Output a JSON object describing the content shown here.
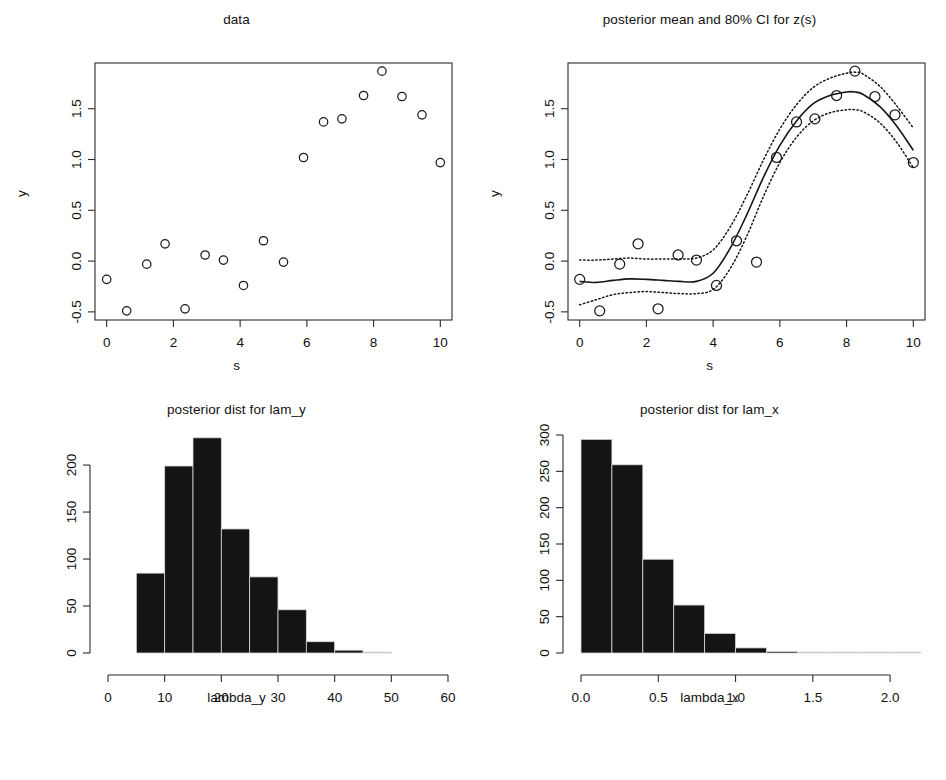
{
  "figure": {
    "width": 946,
    "height": 780,
    "background": "#ffffff",
    "foreground": "#111111",
    "bar_color": "#141414"
  },
  "panels": {
    "data": {
      "title": "data",
      "xlabel": "s",
      "ylabel": "y"
    },
    "posterior": {
      "title": "posterior mean and 80% CI for z(s)",
      "xlabel": "s",
      "ylabel": "y"
    },
    "lam_y": {
      "title": "posterior dist for lam_y",
      "xlabel": "lambda_y",
      "ylabel": ""
    },
    "lam_x": {
      "title": "posterior dist for lam_x",
      "xlabel": "lambda_x",
      "ylabel": ""
    }
  },
  "chart_data": [
    {
      "id": "data",
      "type": "scatter",
      "title": "data",
      "xlabel": "s",
      "ylabel": "y",
      "xlim": [
        -0.35,
        10.35
      ],
      "ylim": [
        -0.58,
        1.95
      ],
      "xticks": [
        0,
        2,
        4,
        6,
        8,
        10
      ],
      "xticklabels": [
        "0",
        "2",
        "4",
        "6",
        "8",
        "10"
      ],
      "yticks": [
        -0.5,
        0.0,
        0.5,
        1.0,
        1.5
      ],
      "yticklabels": [
        "-0.5",
        "0.0",
        "0.5",
        "1.0",
        "1.5"
      ],
      "grid": false,
      "legend": false,
      "marker": "open-circle",
      "x": [
        0.0,
        0.6,
        1.2,
        1.75,
        2.35,
        2.95,
        3.5,
        4.1,
        4.7,
        5.3,
        5.9,
        6.5,
        7.05,
        7.7,
        8.25,
        8.85,
        9.45,
        10.0
      ],
      "y": [
        -0.18,
        -0.49,
        -0.03,
        0.17,
        -0.47,
        0.06,
        0.01,
        -0.24,
        0.2,
        -0.01,
        1.02,
        1.37,
        1.4,
        1.63,
        1.87,
        1.62,
        1.44,
        0.97
      ]
    },
    {
      "id": "posterior",
      "type": "line",
      "title": "posterior mean and 80% CI for z(s)",
      "xlabel": "s",
      "ylabel": "y",
      "xlim": [
        -0.35,
        10.35
      ],
      "ylim": [
        -0.58,
        1.95
      ],
      "xticks": [
        0,
        2,
        4,
        6,
        8,
        10
      ],
      "xticklabels": [
        "0",
        "2",
        "4",
        "6",
        "8",
        "10"
      ],
      "yticks": [
        -0.5,
        0.0,
        0.5,
        1.0,
        1.5
      ],
      "yticklabels": [
        "-0.5",
        "0.0",
        "0.5",
        "1.0",
        "1.5"
      ],
      "grid": false,
      "legend": false,
      "marker": "open-circle",
      "scatter_x": [
        0.0,
        0.6,
        1.2,
        1.75,
        2.35,
        2.95,
        3.5,
        4.1,
        4.7,
        5.3,
        5.9,
        6.5,
        7.05,
        7.7,
        8.25,
        8.85,
        9.45,
        10.0
      ],
      "scatter_y": [
        -0.18,
        -0.49,
        -0.03,
        0.17,
        -0.47,
        0.06,
        0.01,
        -0.24,
        0.2,
        -0.01,
        1.02,
        1.37,
        1.4,
        1.63,
        1.87,
        1.62,
        1.44,
        0.97
      ],
      "series": [
        {
          "name": "posterior mean",
          "style": "solid",
          "x": [
            0.0,
            0.5,
            1.0,
            1.5,
            2.0,
            2.5,
            3.0,
            3.5,
            4.0,
            4.5,
            5.0,
            5.5,
            6.0,
            6.5,
            7.0,
            7.5,
            8.0,
            8.25,
            8.5,
            9.0,
            9.5,
            10.0
          ],
          "y": [
            -0.2,
            -0.21,
            -0.19,
            -0.175,
            -0.18,
            -0.19,
            -0.2,
            -0.2,
            -0.12,
            0.12,
            0.45,
            0.82,
            1.14,
            1.38,
            1.55,
            1.63,
            1.665,
            1.665,
            1.64,
            1.52,
            1.33,
            1.09
          ]
        },
        {
          "name": "80% CI upper",
          "style": "dotted",
          "x": [
            0.0,
            0.5,
            1.0,
            1.5,
            2.0,
            2.5,
            3.0,
            3.5,
            4.0,
            4.5,
            5.0,
            5.5,
            6.0,
            6.5,
            7.0,
            7.5,
            8.0,
            8.25,
            8.5,
            9.0,
            9.5,
            10.0
          ],
          "y": [
            0.01,
            0.01,
            0.02,
            0.03,
            0.02,
            0.02,
            0.02,
            0.03,
            0.11,
            0.33,
            0.64,
            0.99,
            1.3,
            1.54,
            1.71,
            1.8,
            1.85,
            1.86,
            1.84,
            1.72,
            1.53,
            1.31
          ]
        },
        {
          "name": "80% CI lower",
          "style": "dotted",
          "x": [
            0.0,
            0.5,
            1.0,
            1.5,
            2.0,
            2.5,
            3.0,
            3.5,
            4.0,
            4.5,
            5.0,
            5.5,
            6.0,
            6.5,
            7.0,
            7.5,
            8.0,
            8.25,
            8.5,
            9.0,
            9.5,
            10.0
          ],
          "y": [
            -0.43,
            -0.38,
            -0.33,
            -0.31,
            -0.3,
            -0.31,
            -0.32,
            -0.32,
            -0.28,
            -0.08,
            0.24,
            0.63,
            0.97,
            1.22,
            1.38,
            1.46,
            1.49,
            1.49,
            1.47,
            1.36,
            1.17,
            0.92
          ]
        }
      ]
    },
    {
      "id": "lam_y",
      "type": "bar",
      "title": "posterior dist for lam_y",
      "xlabel": "lambda_y",
      "ylabel": "",
      "xlim": [
        0,
        60
      ],
      "ylim": [
        0,
        232
      ],
      "xticks": [
        0,
        10,
        20,
        30,
        40,
        50,
        60
      ],
      "xticklabels": [
        "0",
        "10",
        "20",
        "30",
        "40",
        "50",
        "60"
      ],
      "yticks": [
        0,
        50,
        100,
        150,
        200
      ],
      "yticklabels": [
        "0",
        "50",
        "100",
        "150",
        "200"
      ],
      "grid": false,
      "legend": false,
      "bin_edges": [
        5,
        10,
        15,
        20,
        25,
        30,
        35,
        40,
        45,
        50
      ],
      "values": [
        85,
        199,
        229,
        132,
        81,
        46,
        12,
        3,
        0
      ]
    },
    {
      "id": "lam_x",
      "type": "bar",
      "title": "posterior dist for lam_x",
      "xlabel": "lambda_x",
      "ylabel": "",
      "xlim": [
        0,
        2.2
      ],
      "ylim": [
        0,
        300
      ],
      "xticks": [
        0.0,
        0.5,
        1.0,
        1.5,
        2.0
      ],
      "xticklabels": [
        "0.0",
        "0.5",
        "1.0",
        "1.5",
        "2.0"
      ],
      "yticks": [
        0,
        50,
        100,
        150,
        200,
        250,
        300
      ],
      "yticklabels": [
        "0",
        "50",
        "100",
        "150",
        "200",
        "250",
        "300"
      ],
      "grid": false,
      "legend": false,
      "bin_edges": [
        0.0,
        0.2,
        0.4,
        0.6,
        0.8,
        1.0,
        1.2,
        1.4,
        1.6,
        1.8,
        2.0,
        2.2
      ],
      "values": [
        294,
        259,
        129,
        66,
        27,
        7,
        2,
        0,
        0,
        0,
        1
      ]
    }
  ]
}
